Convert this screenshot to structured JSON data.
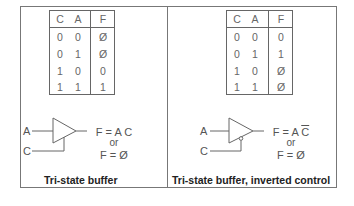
{
  "panels": [
    {
      "id": "tri-state-buffer",
      "table": {
        "headers": [
          "C",
          "A",
          "F"
        ],
        "rows": [
          [
            "0",
            "0",
            "Ø"
          ],
          [
            "0",
            "1",
            "Ø"
          ],
          [
            "1",
            "0",
            "0"
          ],
          [
            "1",
            "1",
            "1"
          ]
        ]
      },
      "inputs": {
        "a": "A",
        "c": "C"
      },
      "equation": {
        "line1": "F = A C",
        "or": "or",
        "line2": "F = Ø"
      },
      "caption": "Tri-state buffer"
    },
    {
      "id": "tri-state-buffer-inverted",
      "table": {
        "headers": [
          "C",
          "A",
          "F"
        ],
        "rows": [
          [
            "0",
            "0",
            "0"
          ],
          [
            "0",
            "1",
            "1"
          ],
          [
            "1",
            "0",
            "Ø"
          ],
          [
            "1",
            "1",
            "Ø"
          ]
        ]
      },
      "inputs": {
        "a": "A",
        "c": "C"
      },
      "equation": {
        "line1_prefix": "F = A ",
        "line1_bar": "C",
        "or": "or",
        "line2": "F = Ø"
      },
      "caption": "Tri-state buffer, inverted control"
    }
  ],
  "colors": {
    "line": "#666666",
    "text": "#555555",
    "caption": "#222222"
  }
}
